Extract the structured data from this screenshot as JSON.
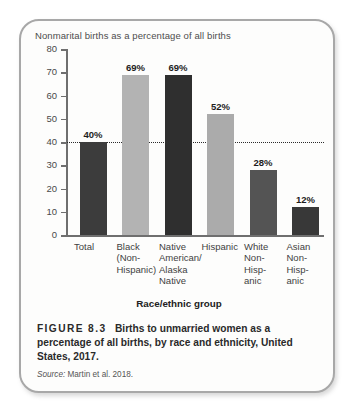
{
  "chart_data": {
    "type": "bar",
    "title": "Nonmarital births as a percentage of all births",
    "xlabel": "Race/ethnic group",
    "ylabel": "",
    "ylim": [
      0,
      80
    ],
    "yticks": [
      0,
      10,
      20,
      30,
      40,
      50,
      60,
      70,
      80
    ],
    "grid": false,
    "legend": "none",
    "reference_line": {
      "value": 40,
      "style": "dotted"
    },
    "categories": [
      "Total",
      "Black (Non-Hispanic)",
      "Native American/ Alaska Native",
      "Hispanic",
      "White Non-Hisp- anic",
      "Asian Non-Hisp- anic"
    ],
    "category_lines": [
      [
        "Total"
      ],
      [
        "Black",
        "(Non-",
        "Hispanic)"
      ],
      [
        "Native",
        "American/",
        "Alaska",
        "Native"
      ],
      [
        "Hispanic"
      ],
      [
        "White",
        "Non-",
        "Hisp-",
        "anic"
      ],
      [
        "Asian",
        "Non-",
        "Hisp-",
        "anic"
      ]
    ],
    "values": [
      40,
      69,
      69,
      52,
      28,
      12
    ],
    "value_labels": [
      "40%",
      "69%",
      "69%",
      "52%",
      "28%",
      "12%"
    ],
    "bar_colors": [
      "#3c3c3c",
      "#b3b3b3",
      "#2f2f2f",
      "#ababab",
      "#545454",
      "#383838"
    ]
  },
  "caption": {
    "figure_number": "FIGURE 8.3",
    "text": "Births to unmarried women as a percentage of all births, by race and ethnicity, United States, 2017."
  },
  "source": {
    "label": "Source:",
    "text": "Martin et al. 2018."
  }
}
